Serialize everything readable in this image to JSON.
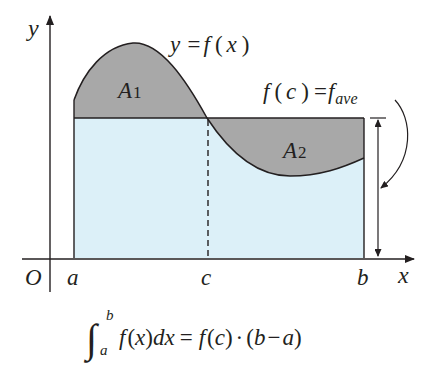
{
  "figure": {
    "type": "mean-value-theorem-for-integrals",
    "colors": {
      "rectangle_fill": "#dcf0f8",
      "shaded_area_fill": "#a8a8a8",
      "line": "#231f20",
      "background": "#ffffff"
    }
  },
  "axes": {
    "y_label": "y",
    "x_label": "x",
    "origin_label": "O"
  },
  "ticks": {
    "a": "a",
    "c": "c",
    "b": "b"
  },
  "curve_label": {
    "prefix": "y =",
    "func": "f",
    "open": "(",
    "var": "x",
    "close": ")"
  },
  "level_label": {
    "func": "f",
    "open": "(",
    "var": "c",
    "close": ")",
    "eq": "=",
    "f": "f",
    "sub": "ave"
  },
  "regions": {
    "A1": {
      "letter": "A",
      "index": "1"
    },
    "A2": {
      "letter": "A",
      "index": "2"
    }
  },
  "formula": {
    "integral_sign": "∫",
    "upper": "b",
    "lower": "a",
    "integrand": "f",
    "open1": "(",
    "x": "x",
    "close1": ")",
    "dx": "dx",
    "equals": "=",
    "f2": "f",
    "open2": "(",
    "c": "c",
    "close2": ")",
    "dot": "·",
    "open3": "(",
    "b": "b",
    "minus": "−",
    "a": "a",
    "close3": ")"
  }
}
